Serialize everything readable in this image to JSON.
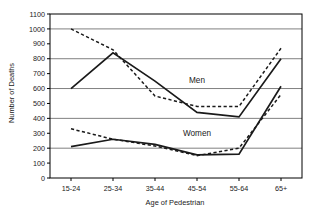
{
  "chart_data": {
    "type": "line",
    "title": "",
    "xlabel": "Age of Pedestrian",
    "ylabel": "Number of Deaths",
    "categories": [
      "15-24",
      "25-34",
      "35-44",
      "45-54",
      "55-64",
      "65+"
    ],
    "ylim": [
      0,
      1100
    ],
    "yticks": [
      0,
      100,
      200,
      300,
      400,
      500,
      600,
      700,
      800,
      900,
      1000,
      1100
    ],
    "ytick_labels": [
      "0",
      "100",
      "200",
      "300",
      "400",
      "500",
      "600",
      "700",
      "800",
      "900",
      "1000",
      "1100"
    ],
    "gridlines": [
      200,
      400,
      600,
      800,
      1000
    ],
    "grid": true,
    "legend": "inline-annotations",
    "annotations": [
      {
        "text": "Men",
        "x_category": "45-54",
        "y_value": 640
      },
      {
        "text": "Women",
        "x_category": "45-54",
        "y_value": 285
      }
    ],
    "series": [
      {
        "name": "Men solid",
        "group": "Men",
        "style": "solid",
        "values": [
          600,
          840,
          650,
          440,
          410,
          800
        ]
      },
      {
        "name": "Men dashed",
        "group": "Men",
        "style": "dashed",
        "values": [
          1000,
          860,
          550,
          480,
          480,
          870
        ]
      },
      {
        "name": "Women solid",
        "group": "Women",
        "style": "solid",
        "values": [
          210,
          260,
          225,
          155,
          160,
          615
        ]
      },
      {
        "name": "Women dashed",
        "group": "Women",
        "style": "dashed",
        "values": [
          330,
          260,
          215,
          150,
          200,
          560
        ]
      }
    ]
  },
  "colors": {
    "line": "#1a1a1a",
    "grid": "#808080",
    "axis": "#000000",
    "text": "#1a1a1a",
    "background": "#ffffff"
  }
}
